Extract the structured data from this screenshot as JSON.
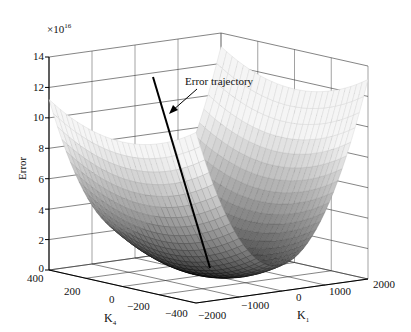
{
  "chart_data": {
    "type": "surface3d",
    "title": "",
    "annotation": "Error trajectory",
    "zlabel": "Error",
    "zscale": "×10",
    "zscale_exp": "16",
    "xlabel": "K",
    "xlabel_sub": "1",
    "ylabel": "K",
    "ylabel_sub": "4",
    "zlim": [
      0,
      14
    ],
    "xlim": [
      -2000,
      2000
    ],
    "ylim": [
      -400,
      400
    ],
    "z_ticks": [
      "0",
      "2",
      "4",
      "6",
      "8",
      "10",
      "12",
      "14"
    ],
    "x_ticks": [
      "−2000",
      "−1000",
      "0",
      "1000",
      "2000"
    ],
    "y_ticks": [
      "400",
      "200",
      "0",
      "−200",
      "−400"
    ],
    "grid": true,
    "colormap": "gray",
    "surface": "paraboloid bowl, minimum ≈0 near (K1≈0, K4≈0); rises to ≈10×10^16 at K1=-2000 edge and ≈12×10^16 at K1=2000 edge",
    "trajectory": {
      "label": "Error trajectory",
      "start_error": 12.5,
      "end_error": 0.0,
      "description": "straight descent from upper region to the bowl minimum"
    }
  }
}
